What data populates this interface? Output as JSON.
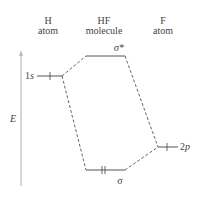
{
  "headers": {
    "h_atom": {
      "line1": "H",
      "line2": "atom"
    },
    "hf_molecule": {
      "line1": "HF",
      "line2": "molecule"
    },
    "f_atom": {
      "line1": "F",
      "line2": "atom"
    }
  },
  "axis": {
    "label": "E"
  },
  "levels": {
    "h_1s": {
      "label": "1s",
      "electrons": 1
    },
    "sigma_star": {
      "label": "σ*",
      "electrons": 0
    },
    "sigma": {
      "label": "σ",
      "electrons": 2
    },
    "f_2p": {
      "label": "2p",
      "electrons": 1
    }
  },
  "colors": {
    "line": "#555555",
    "axis": "#bbbbbb",
    "text": "#444444"
  }
}
